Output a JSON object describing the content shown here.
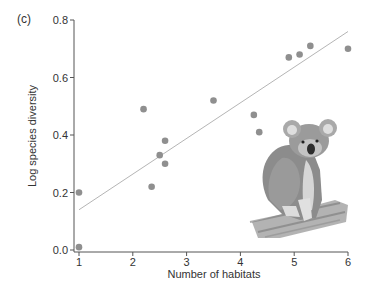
{
  "panel_label": "(c)",
  "chart_data": {
    "type": "scatter",
    "title": "",
    "xlabel": "Number of habitats",
    "ylabel": "Log species diversity",
    "xlim": [
      1,
      6
    ],
    "ylim": [
      0.0,
      0.8
    ],
    "x_ticks": [
      "1",
      "2",
      "3",
      "4",
      "5",
      "6"
    ],
    "y_ticks": [
      "0.0",
      "0.2",
      "0.4",
      "0.6",
      "0.8"
    ],
    "grid": false,
    "legend": null,
    "series": [
      {
        "name": "observations",
        "color": "#8f8f8f",
        "points": [
          {
            "x": 1.0,
            "y": 0.2
          },
          {
            "x": 1.0,
            "y": 0.01
          },
          {
            "x": 2.2,
            "y": 0.49
          },
          {
            "x": 2.35,
            "y": 0.22
          },
          {
            "x": 2.5,
            "y": 0.33
          },
          {
            "x": 2.6,
            "y": 0.38
          },
          {
            "x": 2.6,
            "y": 0.3
          },
          {
            "x": 3.5,
            "y": 0.52
          },
          {
            "x": 4.25,
            "y": 0.47
          },
          {
            "x": 4.35,
            "y": 0.41
          },
          {
            "x": 4.9,
            "y": 0.67
          },
          {
            "x": 5.1,
            "y": 0.68
          },
          {
            "x": 5.3,
            "y": 0.71
          },
          {
            "x": 6.0,
            "y": 0.7
          }
        ]
      }
    ],
    "trendline": {
      "type": "linear",
      "color": "#b5b5b5",
      "x": [
        1.0,
        6.0
      ],
      "y": [
        0.14,
        0.76
      ]
    },
    "annotations": [
      {
        "type": "illustration",
        "subject": "koala sitting on a branch",
        "position": "lower-right"
      }
    ]
  }
}
